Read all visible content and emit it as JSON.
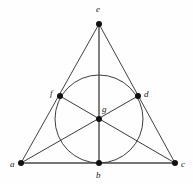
{
  "figure": {
    "background_color": "#fefefe",
    "line_color": "#2b2b2b",
    "point_color": "#111111",
    "width": 194,
    "height": 185
  },
  "points": {
    "a": {
      "label": "a",
      "x": 21,
      "y": 163,
      "label_x": 10,
      "label_y": 160
    },
    "b": {
      "label": "b",
      "x": 99,
      "y": 163,
      "label_x": 96,
      "label_y": 171
    },
    "c": {
      "label": "c",
      "x": 175,
      "y": 163,
      "label_x": 181,
      "label_y": 160
    },
    "d": {
      "label": "d",
      "x": 138,
      "y": 96,
      "label_x": 144,
      "label_y": 90
    },
    "e": {
      "label": "e",
      "x": 99,
      "y": 24,
      "label_x": 96,
      "label_y": 5
    },
    "f": {
      "label": "f",
      "x": 60,
      "y": 96,
      "label_x": 50,
      "label_y": 89
    },
    "g": {
      "label": "g",
      "x": 99,
      "y": 119,
      "label_x": 102,
      "label_y": 105
    }
  },
  "incircle": {
    "name": "inscribed-circle",
    "center_x": 99,
    "center_y": 119,
    "radius": 44
  },
  "segments": [
    {
      "name": "side-ae",
      "from": "a",
      "to": "e",
      "kind": "edge"
    },
    {
      "name": "side-ce",
      "from": "c",
      "to": "e",
      "kind": "edge"
    },
    {
      "name": "side-ac",
      "from": "a",
      "to": "c",
      "kind": "base"
    },
    {
      "name": "median-eb",
      "from": "e",
      "to": "b",
      "kind": "altitude"
    },
    {
      "name": "median-ad",
      "from": "a",
      "to": "d",
      "kind": "cevian"
    },
    {
      "name": "median-cf",
      "from": "c",
      "to": "f",
      "kind": "cevian"
    }
  ],
  "point_order": [
    "a",
    "b",
    "c",
    "d",
    "e",
    "f",
    "g"
  ]
}
